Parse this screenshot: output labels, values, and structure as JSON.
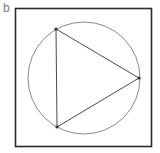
{
  "panel": {
    "label": "b"
  },
  "diagram": {
    "frame": {
      "x": 15.5,
      "y": 8.5,
      "width": 136,
      "height": 138,
      "stroke": "#2b2b2b",
      "stroke_width": 1.6
    },
    "circle": {
      "cx": 84,
      "cy": 78,
      "r": 56,
      "stroke": "#8a8a8a",
      "stroke_width": 1
    },
    "triangle": {
      "stroke": "#4a4a4a",
      "stroke_width": 1,
      "vertices": [
        {
          "name": "top-left",
          "x": 56,
          "y": 29
        },
        {
          "name": "right",
          "x": 139,
          "y": 78
        },
        {
          "name": "bottom-left",
          "x": 57,
          "y": 127
        }
      ]
    },
    "vertex_dot": {
      "r": 1.6,
      "fill": "#333333"
    }
  }
}
